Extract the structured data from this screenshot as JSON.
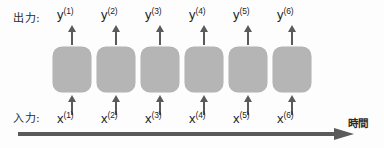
{
  "diagram": {
    "output_row_label": "出力:",
    "input_row_label": "入力:",
    "time_axis_label": "時間",
    "colors": {
      "cell_fill": "#b5b5b5",
      "arrow": "#5a5a5a",
      "text": "#1d1d1d",
      "background": "#fdfdfd"
    },
    "timesteps": [
      {
        "index": 1,
        "output_base": "y",
        "output_superscript": "(1)",
        "input_base": "x",
        "input_superscript": "(1)",
        "x": 53
      },
      {
        "index": 2,
        "output_base": "y",
        "output_superscript": "(2)",
        "input_base": "x",
        "input_superscript": "(2)",
        "x": 97
      },
      {
        "index": 3,
        "output_base": "y",
        "output_superscript": "(3)",
        "input_base": "x",
        "input_superscript": "(3)",
        "x": 141
      },
      {
        "index": 4,
        "output_base": "y",
        "output_superscript": "(4)",
        "input_base": "x",
        "input_superscript": "(4)",
        "x": 185
      },
      {
        "index": 5,
        "output_base": "y",
        "output_superscript": "(5)",
        "input_base": "x",
        "input_superscript": "(5)",
        "x": 229
      },
      {
        "index": 6,
        "output_base": "y",
        "output_superscript": "(6)",
        "input_base": "x",
        "input_superscript": "(6)",
        "x": 273
      }
    ]
  }
}
